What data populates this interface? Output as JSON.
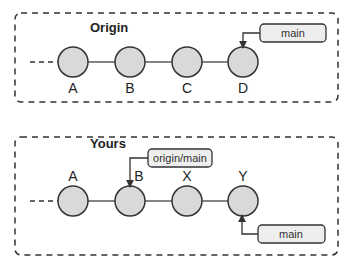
{
  "colors": {
    "node_fill": "#d9d9d9",
    "stroke": "#333333",
    "tag_fill": "#eeeeee",
    "background": "#ffffff"
  },
  "panels": [
    {
      "title": "Origin",
      "nodes": [
        "A",
        "B",
        "C",
        "D"
      ],
      "branch_tags": [
        {
          "label": "main",
          "points_to": "D",
          "position": "above"
        }
      ]
    },
    {
      "title": "Yours",
      "nodes": [
        "A",
        "B",
        "X",
        "Y"
      ],
      "branch_tags": [
        {
          "label": "origin/main",
          "points_to": "B",
          "position": "above"
        },
        {
          "label": "main",
          "points_to": "Y",
          "position": "below"
        }
      ]
    }
  ]
}
